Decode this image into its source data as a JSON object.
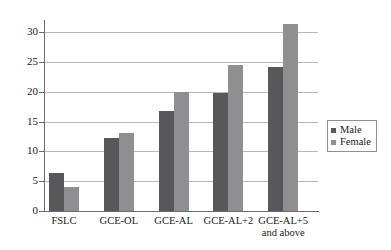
{
  "chart_data": {
    "type": "bar",
    "title": "",
    "subtitle": "",
    "xlabel": "",
    "ylabel": "",
    "ylim": [
      0,
      32
    ],
    "yticks": [
      0,
      5,
      10,
      15,
      20,
      25,
      30
    ],
    "ytick_labels": [
      "0",
      "5",
      "10",
      "15",
      "20",
      "25",
      "30"
    ],
    "grid": true,
    "legend_position": "right",
    "categories": [
      "FSLC",
      "GCE-OL",
      "GCE-AL",
      "GCE-AL+2",
      "GCE-AL+5\nand above"
    ],
    "series": [
      {
        "name": "Male",
        "color": "#58585a",
        "values": [
          6.4,
          12.3,
          16.8,
          19.7,
          24.2
        ]
      },
      {
        "name": "Female",
        "color": "#8f8f91",
        "values": [
          4.1,
          13.1,
          20.0,
          24.5,
          31.3
        ]
      }
    ]
  },
  "legend": {
    "entries": [
      {
        "label": "Male",
        "swatch": "male-swatch"
      },
      {
        "label": "Female",
        "swatch": "female-swatch"
      }
    ]
  },
  "colors": {
    "male": "#58585a",
    "female": "#8f8f91",
    "gridline": "#b9b9b9",
    "axis": "#6b6b6b",
    "background": "#ffffff",
    "text": "#1a1a1a"
  }
}
